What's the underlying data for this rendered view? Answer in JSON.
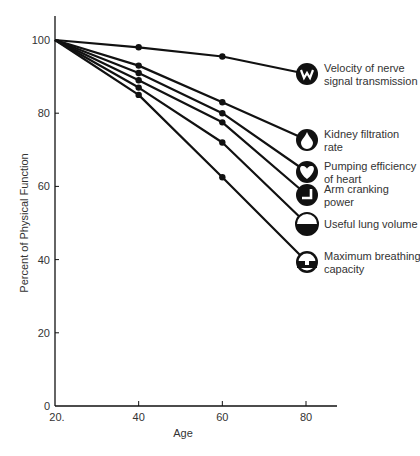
{
  "chart_data": {
    "type": "line",
    "title": "",
    "xlabel": "Age",
    "ylabel": "Percent of Physical Function",
    "x": [
      20,
      40,
      60,
      80
    ],
    "x_tick_labels": [
      "20.",
      "40",
      "60",
      "80"
    ],
    "y_ticks": [
      0,
      20,
      40,
      60,
      80,
      100
    ],
    "y_tick_labels": [
      "0",
      "20",
      "40",
      "60",
      "80",
      "100"
    ],
    "xlim": [
      20,
      86
    ],
    "ylim": [
      0,
      106
    ],
    "grid": false,
    "legend_position": "right, inline at line ends",
    "series": [
      {
        "name": "Velocity of nerve signal transmission",
        "label_lines": [
          "Velocity of nerve",
          "signal transmission"
        ],
        "icon": "nerve-w-icon",
        "values": [
          100,
          98,
          95.5,
          91
        ]
      },
      {
        "name": "Kidney filtration rate",
        "label_lines": [
          "Kidney filtration",
          "rate"
        ],
        "icon": "drop-icon",
        "values": [
          100,
          93,
          83,
          73
        ]
      },
      {
        "name": "Pumping efficiency of heart",
        "label_lines": [
          "Pumping efficiency",
          "of heart"
        ],
        "icon": "heart-icon",
        "values": [
          100,
          91,
          80,
          64
        ]
      },
      {
        "name": "Arm cranking power",
        "label_lines": [
          "Arm cranking",
          "power"
        ],
        "icon": "arm-crank-icon",
        "values": [
          100,
          89,
          77.5,
          58
        ]
      },
      {
        "name": "Useful lung volume",
        "label_lines": [
          "Useful lung volume"
        ],
        "icon": "lung-half-icon",
        "values": [
          100,
          87,
          72,
          50
        ]
      },
      {
        "name": "Maximum breathing capacity",
        "label_lines": [
          "Maximum breathing",
          "capacity"
        ],
        "icon": "breathing-icon",
        "values": [
          100,
          85,
          62.5,
          40
        ]
      }
    ]
  },
  "colors": {
    "line": "#111111",
    "text": "#333333",
    "background": "#ffffff"
  }
}
